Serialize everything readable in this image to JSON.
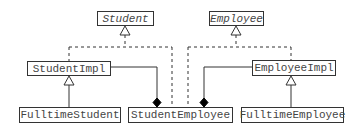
{
  "diagram": {
    "type": "UML class diagram",
    "classes": {
      "student": {
        "name": "Student",
        "abstract": true
      },
      "employee": {
        "name": "Employee",
        "abstract": true
      },
      "student_impl": {
        "name": "StudentImpl"
      },
      "employee_impl": {
        "name": "EmployeeImpl"
      },
      "fulltime_student": {
        "name": "FulltimeStudent"
      },
      "student_employee": {
        "name": "StudentEmployee"
      },
      "fulltime_employee": {
        "name": "FulltimeEmployee"
      }
    },
    "relations": [
      {
        "from": "StudentImpl",
        "to": "Student",
        "kind": "realization"
      },
      {
        "from": "StudentEmployee",
        "to": "Student",
        "kind": "realization"
      },
      {
        "from": "EmployeeImpl",
        "to": "Employee",
        "kind": "realization"
      },
      {
        "from": "StudentEmployee",
        "to": "Employee",
        "kind": "realization"
      },
      {
        "from": "FulltimeStudent",
        "to": "StudentImpl",
        "kind": "generalization"
      },
      {
        "from": "FulltimeEmployee",
        "to": "EmployeeImpl",
        "kind": "generalization"
      },
      {
        "whole": "StudentEmployee",
        "part": "StudentImpl",
        "kind": "composition"
      },
      {
        "whole": "StudentEmployee",
        "part": "EmployeeImpl",
        "kind": "composition"
      }
    ],
    "colors": {
      "line": "#333333",
      "text": "#444444",
      "background": "#ffffff"
    }
  }
}
